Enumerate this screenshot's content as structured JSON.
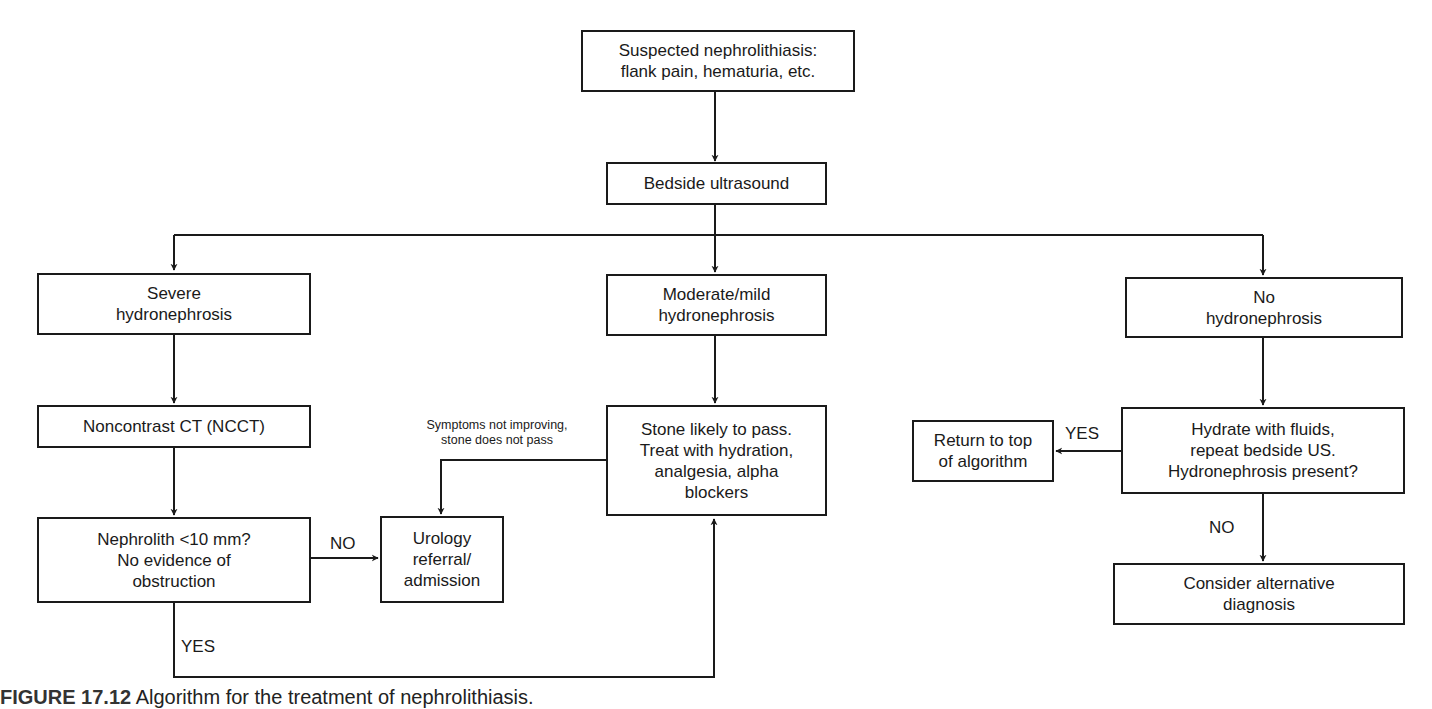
{
  "diagram": {
    "type": "flowchart",
    "title": "Algorithm for the treatment of nephrolithiasis",
    "nodes": {
      "start": "Suspected nephrolithiasis:\nflank pain, hematuria, etc.",
      "bedside_us": "Bedside ultrasound",
      "severe": "Severe\nhydronephrosis",
      "moderate": "Moderate/mild\nhydronephrosis",
      "none": "No\nhydronephrosis",
      "ncct": "Noncontrast CT (NCCT)",
      "nephrolith": "Nephrolith <10 mm?\nNo evidence of\nobstruction",
      "urology": "Urology\nreferral/\nadmission",
      "stone_pass": "Stone likely to pass.\nTreat with hydration,\nanalgesia, alpha\nblockers",
      "hydrate": "Hydrate with fluids,\nrepeat bedside US.\nHydronephrosis present?",
      "return_top": "Return to top\nof algorithm",
      "alternative": "Consider alternative\ndiagnosis"
    },
    "edge_labels": {
      "nephrolith_no": "NO",
      "nephrolith_yes": "YES",
      "symptoms": "Symptoms not improving,\nstone does not pass",
      "hydrate_yes": "YES",
      "hydrate_no": "NO"
    },
    "edges": [
      {
        "from": "start",
        "to": "bedside_us"
      },
      {
        "from": "bedside_us",
        "to": "severe"
      },
      {
        "from": "bedside_us",
        "to": "moderate"
      },
      {
        "from": "bedside_us",
        "to": "none"
      },
      {
        "from": "severe",
        "to": "ncct"
      },
      {
        "from": "ncct",
        "to": "nephrolith"
      },
      {
        "from": "nephrolith",
        "to": "urology",
        "label": "NO"
      },
      {
        "from": "nephrolith",
        "to": "stone_pass",
        "label": "YES"
      },
      {
        "from": "moderate",
        "to": "stone_pass"
      },
      {
        "from": "stone_pass",
        "to": "urology",
        "label": "Symptoms not improving, stone does not pass"
      },
      {
        "from": "none",
        "to": "hydrate"
      },
      {
        "from": "hydrate",
        "to": "return_top",
        "label": "YES"
      },
      {
        "from": "hydrate",
        "to": "alternative",
        "label": "NO"
      }
    ]
  },
  "caption": {
    "figure_number": "FIGURE 17.12",
    "text": "Algorithm for the treatment of nephrolithiasis."
  }
}
